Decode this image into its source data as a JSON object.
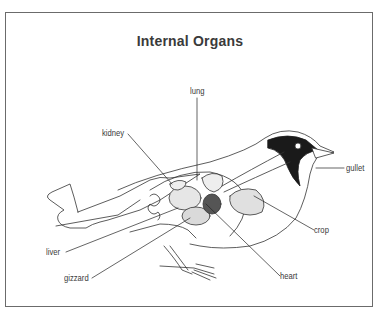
{
  "diagram": {
    "title": "Internal Organs",
    "labels": {
      "lung": "lung",
      "kidney": "kidney",
      "gullet": "gullet",
      "crop": "crop",
      "liver": "liver",
      "gizzard": "gizzard",
      "heart": "heart"
    },
    "colors": {
      "line": "#333333",
      "frame": "#6b6b6b",
      "head_dark": "#1a1a1a",
      "organ_shade": "#cfcfcf"
    }
  }
}
